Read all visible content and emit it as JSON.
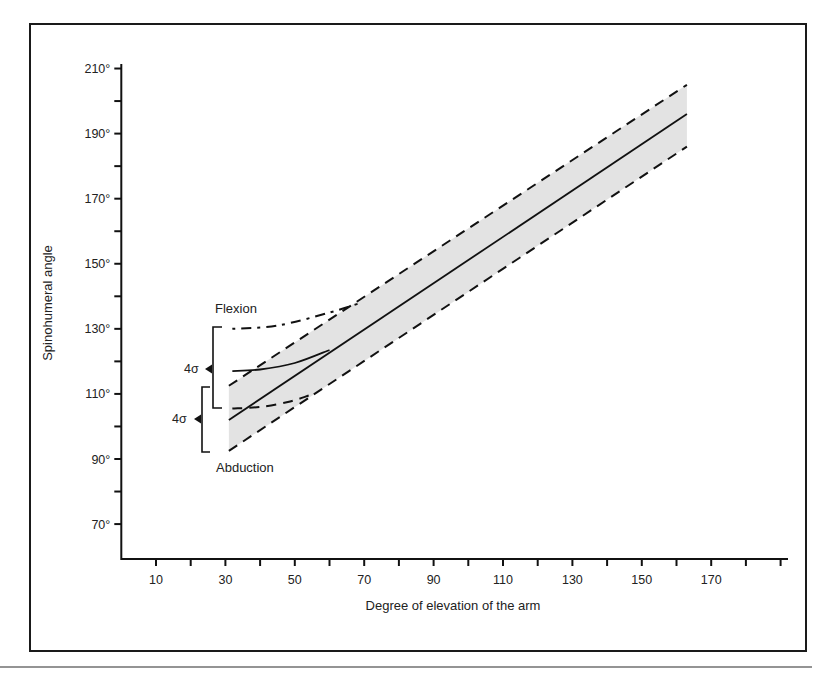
{
  "chart_data": {
    "type": "line",
    "title": "",
    "xlabel": "Degree of elevation of the arm",
    "ylabel": "Spinohumeral angle",
    "xlim": [
      0,
      192
    ],
    "ylim": [
      60,
      212
    ],
    "x_ticks_major": [
      10,
      30,
      50,
      70,
      90,
      110,
      130,
      150,
      170
    ],
    "x_ticks_minor": [
      20,
      40,
      60,
      80,
      100,
      120,
      140,
      160,
      180,
      190
    ],
    "y_ticks_major": [
      70,
      90,
      110,
      130,
      150,
      170,
      190,
      210
    ],
    "y_ticks_major_labels": [
      "70°",
      "90°",
      "110°",
      "130°",
      "150°",
      "170°",
      "190°",
      "210°"
    ],
    "y_ticks_minor": [
      80,
      100,
      120,
      140,
      160,
      180,
      200
    ],
    "grid": false,
    "legend": null,
    "series": [
      {
        "name": "Abduction mean",
        "style": "solid",
        "x": [
          31,
          163
        ],
        "y": [
          102,
          196
        ]
      },
      {
        "name": "Abduction +2σ",
        "style": "dashed",
        "x": [
          31,
          163
        ],
        "y": [
          112.5,
          205
        ]
      },
      {
        "name": "Abduction −2σ",
        "style": "dashed",
        "x": [
          31,
          163
        ],
        "y": [
          92.5,
          186
        ]
      },
      {
        "name": "Flexion mean",
        "style": "solid-curve",
        "x": [
          32,
          40,
          50,
          60
        ],
        "y": [
          117,
          117.5,
          119.5,
          123.5
        ]
      },
      {
        "name": "Flexion +2σ",
        "style": "dash-dot-curve",
        "x": [
          32,
          45,
          60,
          69
        ],
        "y": [
          130,
          131,
          135,
          138
        ]
      },
      {
        "name": "Flexion −2σ",
        "style": "dashed-curve",
        "x": [
          32,
          40,
          48,
          54
        ],
        "y": [
          105.5,
          106,
          107.5,
          109.5
        ]
      }
    ],
    "shaded_band": {
      "description": "±2σ range around abduction mean",
      "x": [
        31,
        163
      ],
      "upper": [
        112.5,
        205
      ],
      "lower": [
        92.5,
        186
      ]
    },
    "annotations": [
      {
        "text": "Flexion",
        "x": 27,
        "y": 135
      },
      {
        "text": "Abduction",
        "x": 27,
        "y": 86
      },
      {
        "text": "4σ",
        "type": "bracket",
        "group": "Flexion",
        "y_range": [
          105.5,
          130
        ]
      },
      {
        "text": "4σ",
        "type": "bracket",
        "group": "Abduction",
        "y_range": [
          92.5,
          112.5
        ]
      }
    ]
  },
  "labels": {
    "flexion": "Flexion",
    "abduction": "Abduction",
    "sigma_flexion": "4σ",
    "sigma_abduction": "4σ"
  }
}
